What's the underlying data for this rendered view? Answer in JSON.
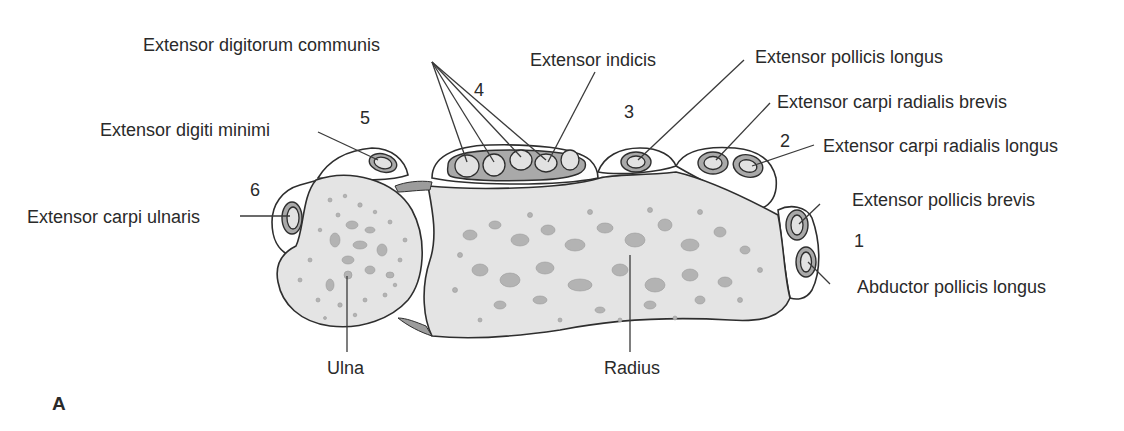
{
  "figure": {
    "panel_label": "A",
    "bones": [
      {
        "id": "ulna",
        "label": "Ulna"
      },
      {
        "id": "radius",
        "label": "Radius"
      }
    ],
    "compartments": [
      {
        "number": "1",
        "tendons": [
          "Extensor pollicis brevis",
          "Abductor pollicis longus"
        ]
      },
      {
        "number": "2",
        "tendons": [
          "Extensor carpi radialis brevis",
          "Extensor carpi radialis longus"
        ]
      },
      {
        "number": "3",
        "tendons": [
          "Extensor pollicis longus"
        ]
      },
      {
        "number": "4",
        "tendons": [
          "Extensor digitorum communis",
          "Extensor indicis"
        ]
      },
      {
        "number": "5",
        "tendons": [
          "Extensor digiti minimi"
        ]
      },
      {
        "number": "6",
        "tendons": [
          "Extensor carpi ulnaris"
        ]
      }
    ],
    "labels": {
      "edc": "Extensor digitorum communis",
      "ei": "Extensor indicis",
      "epl": "Extensor pollicis longus",
      "ecrb": "Extensor carpi radialis brevis",
      "ecrl": "Extensor carpi radialis longus",
      "edm": "Extensor digiti minimi",
      "ecu": "Extensor carpi ulnaris",
      "epb": "Extensor pollicis brevis",
      "apl": "Abductor pollicis longus",
      "ulna": "Ulna",
      "radius": "Radius"
    },
    "numbers": {
      "c1": "1",
      "c2": "2",
      "c3": "3",
      "c4": "4",
      "c5": "5",
      "c6": "6"
    },
    "colors": {
      "bone_fill": "#e4e4e4",
      "sheath_fill": "#a9a9a9",
      "outline": "#2e2e2e",
      "text": "#2a2a2a"
    }
  }
}
